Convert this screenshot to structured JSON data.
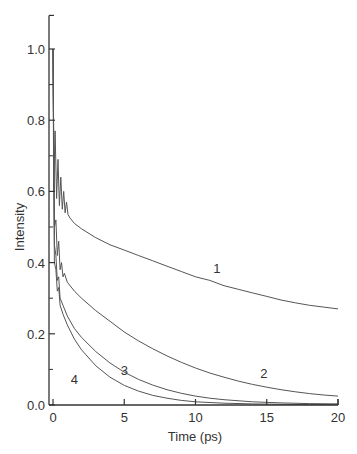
{
  "chart_data": {
    "type": "line",
    "title": "",
    "xlabel": "Time (ps)",
    "ylabel": "Intensity",
    "xlim": [
      0,
      20
    ],
    "ylim": [
      0,
      1.1
    ],
    "x_ticks": [
      0,
      5,
      10,
      15,
      20
    ],
    "x_tick_labels": [
      "0",
      "5",
      "10",
      "15",
      "20"
    ],
    "y_ticks": [
      0.0,
      0.2,
      0.4,
      0.6,
      0.8,
      1.0
    ],
    "y_tick_labels": [
      "0.0",
      "0.2",
      "0.4",
      "0.6",
      "0.8",
      "1.0"
    ],
    "y_minor_ticks": [
      0.1,
      0.3,
      0.5,
      0.7,
      0.9
    ],
    "grid": false,
    "legend": "none (curves labeled inline 1-4)",
    "series": [
      {
        "name": "1",
        "label_pos": [
          11.5,
          0.37
        ],
        "x": [
          0,
          0.05,
          0.15,
          0.25,
          0.35,
          0.45,
          0.55,
          0.65,
          0.75,
          0.85,
          0.95,
          1.05,
          1.2,
          1.5,
          2,
          3,
          4,
          5,
          6,
          7,
          8,
          9,
          10,
          11,
          12,
          13,
          14,
          15,
          16,
          17,
          18,
          19,
          20
        ],
        "values": [
          1.0,
          0.6,
          0.77,
          0.58,
          0.69,
          0.56,
          0.64,
          0.55,
          0.6,
          0.54,
          0.57,
          0.535,
          0.525,
          0.51,
          0.495,
          0.47,
          0.45,
          0.435,
          0.42,
          0.405,
          0.39,
          0.375,
          0.36,
          0.35,
          0.335,
          0.325,
          0.315,
          0.305,
          0.295,
          0.287,
          0.28,
          0.275,
          0.27
        ]
      },
      {
        "name": "2",
        "label_pos": [
          14.8,
          0.075
        ],
        "x": [
          0,
          0.1,
          0.2,
          0.3,
          0.4,
          0.5,
          0.6,
          0.7,
          0.8,
          1.0,
          1.5,
          2,
          3,
          4,
          5,
          6,
          7,
          8,
          9,
          10,
          11,
          12,
          13,
          14,
          15,
          16,
          17,
          18,
          19,
          20
        ],
        "values": [
          1.0,
          0.5,
          0.52,
          0.42,
          0.46,
          0.38,
          0.4,
          0.36,
          0.37,
          0.345,
          0.32,
          0.3,
          0.265,
          0.235,
          0.205,
          0.18,
          0.158,
          0.138,
          0.12,
          0.104,
          0.09,
          0.078,
          0.067,
          0.058,
          0.05,
          0.043,
          0.037,
          0.032,
          0.028,
          0.025
        ]
      },
      {
        "name": "3",
        "label_pos": [
          5.0,
          0.085
        ],
        "x": [
          0,
          0.1,
          0.2,
          0.3,
          0.4,
          0.5,
          0.7,
          1.0,
          1.5,
          2,
          3,
          4,
          5,
          6,
          7,
          8,
          9,
          10,
          11,
          12,
          14,
          16,
          18,
          20
        ],
        "values": [
          1.0,
          0.45,
          0.42,
          0.35,
          0.36,
          0.3,
          0.28,
          0.25,
          0.215,
          0.19,
          0.15,
          0.118,
          0.092,
          0.072,
          0.056,
          0.043,
          0.033,
          0.025,
          0.019,
          0.015,
          0.009,
          0.006,
          0.004,
          0.003
        ]
      },
      {
        "name": "4",
        "label_pos": [
          1.5,
          0.06
        ],
        "x": [
          0,
          0.1,
          0.2,
          0.3,
          0.4,
          0.5,
          0.7,
          1.0,
          1.5,
          2,
          3,
          4,
          5,
          6,
          7,
          8,
          9,
          10,
          12,
          14,
          16,
          18,
          20
        ],
        "values": [
          1.0,
          0.4,
          0.38,
          0.32,
          0.33,
          0.28,
          0.255,
          0.225,
          0.185,
          0.155,
          0.11,
          0.078,
          0.055,
          0.039,
          0.027,
          0.019,
          0.013,
          0.009,
          0.005,
          0.003,
          0.002,
          0.001,
          0.001
        ]
      }
    ]
  },
  "style": {
    "line_color": "#555555",
    "axis_color": "#333333",
    "background": "#ffffff"
  }
}
